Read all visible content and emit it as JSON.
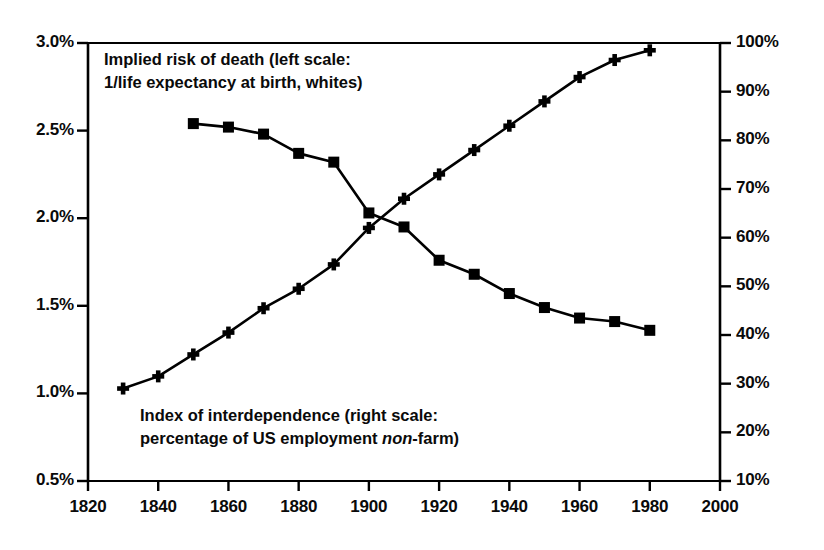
{
  "chart_data": {
    "type": "line",
    "title": "",
    "subtitle": "",
    "xlabel": "",
    "ylabel": "",
    "grid": false,
    "legend_position": "inline-annotations",
    "x_axis": {
      "min": 1820,
      "max": 2000,
      "tick_step": 20,
      "ticks": [
        1820,
        1840,
        1860,
        1880,
        1900,
        1920,
        1940,
        1960,
        1980,
        2000
      ],
      "tick_labels": [
        "1820",
        "1840",
        "1860",
        "1880",
        "1900",
        "1920",
        "1940",
        "1960",
        "1980",
        "2000"
      ]
    },
    "y_axis_left": {
      "label": "Implied risk of death",
      "min": 0.5,
      "max": 3.0,
      "tick_step": 0.5,
      "ticks": [
        0.5,
        1.0,
        1.5,
        2.0,
        2.5,
        3.0
      ],
      "tick_labels": [
        "0.5%",
        "1.0%",
        "1.5%",
        "2.0%",
        "2.5%",
        "3.0%"
      ],
      "unit": "%"
    },
    "y_axis_right": {
      "label": "Index of interdependence",
      "min": 10,
      "max": 100,
      "tick_step": 10,
      "ticks": [
        10,
        20,
        30,
        40,
        50,
        60,
        70,
        80,
        90,
        100
      ],
      "tick_labels": [
        "10%",
        "20%",
        "30%",
        "40%",
        "50%",
        "60%",
        "70%",
        "80%",
        "90%",
        "100%"
      ],
      "unit": "%"
    },
    "series": [
      {
        "name": "Implied risk of death (left scale: 1/life expectancy at birth, whites)",
        "axis": "left",
        "marker": "square",
        "color": "#000000",
        "x": [
          1850,
          1860,
          1870,
          1880,
          1890,
          1900,
          1910,
          1920,
          1930,
          1940,
          1950,
          1960,
          1970,
          1980
        ],
        "values": [
          2.54,
          2.52,
          2.48,
          2.37,
          2.32,
          2.03,
          1.95,
          1.76,
          1.68,
          1.57,
          1.49,
          1.43,
          1.41,
          1.36
        ]
      },
      {
        "name": "Index of interdependence (right scale: percentage of US employment non-farm)",
        "axis": "right",
        "marker": "plus",
        "color": "#000000",
        "x": [
          1830,
          1840,
          1850,
          1860,
          1870,
          1880,
          1890,
          1900,
          1910,
          1920,
          1930,
          1940,
          1950,
          1960,
          1970,
          1980
        ],
        "values": [
          29.0,
          31.5,
          36.0,
          40.5,
          45.5,
          49.5,
          54.5,
          62.0,
          68.0,
          73.0,
          78.0,
          83.0,
          88.0,
          93.0,
          96.5,
          98.5
        ]
      }
    ],
    "annotations": [
      {
        "id": "risk-of-death-label",
        "line1": "Implied risk of death (left scale:",
        "line2": "1/life expectancy at birth, whites)",
        "italic_word": ""
      },
      {
        "id": "interdependence-label",
        "line1": "Index of interdependence (right scale:",
        "line2_pre": "percentage of US employment ",
        "line2_italic": "non",
        "line2_post": "-farm)"
      }
    ]
  },
  "style": {
    "axis_color": "#000000",
    "background": "#ffffff",
    "line_color": "#000000"
  }
}
